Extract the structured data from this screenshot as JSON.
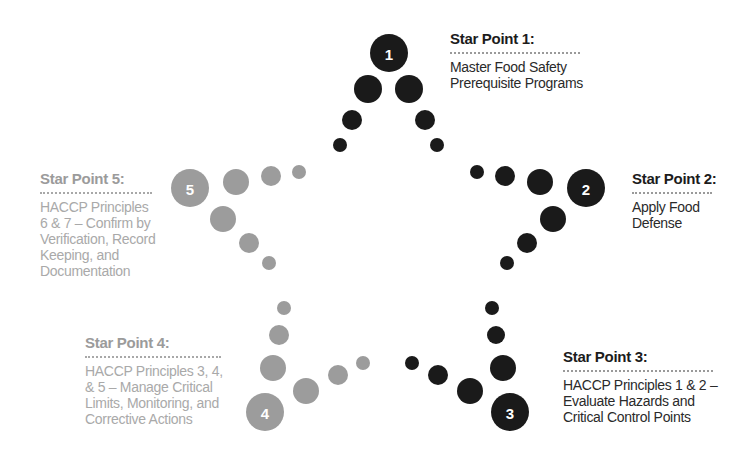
{
  "diagram": {
    "type": "five-point star of dots",
    "colors": {
      "dark": "#1a1a1a",
      "light": "#9c9c9c"
    },
    "star_points": [
      {
        "number": "1",
        "title": "Star Point 1:",
        "body": [
          "Master Food Safety",
          "Prerequisite Programs"
        ],
        "tone": "dark"
      },
      {
        "number": "2",
        "title": "Star Point 2:",
        "body": [
          "Apply Food",
          "Defense"
        ],
        "tone": "dark"
      },
      {
        "number": "3",
        "title": "Star Point 3:",
        "body": [
          "HACCP Principles 1 & 2 –",
          "Evaluate Hazards and",
          "Critical Control Points"
        ],
        "tone": "dark"
      },
      {
        "number": "4",
        "title": "Star Point 4:",
        "body": [
          "HACCP Principles 3, 4,",
          "& 5 – Manage Critical",
          "Limits, Monitoring, and",
          "Corrective Actions"
        ],
        "tone": "light"
      },
      {
        "number": "5",
        "title": "Star Point 5:",
        "body": [
          "HACCP Principles",
          "6 & 7 – Confirm by",
          "Verification, Record",
          "Keeping, and",
          "Documentation"
        ],
        "tone": "light"
      }
    ]
  }
}
